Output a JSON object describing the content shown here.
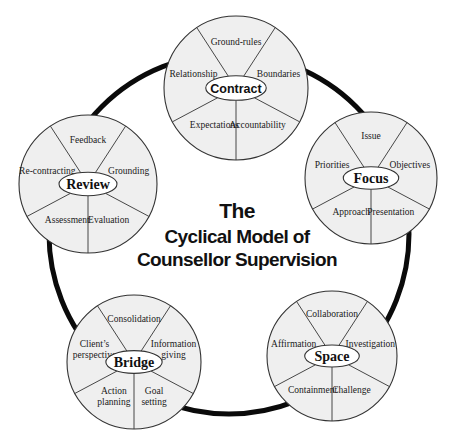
{
  "title": {
    "lines": [
      "The",
      "Cyclical Model of",
      "Counsellor Supervision"
    ]
  },
  "stages": [
    {
      "name": "Contract",
      "hub_style": "sans",
      "segments": [
        "Ground-rules",
        "Boundaries",
        "Accountability",
        "Expectations",
        "Relationship"
      ]
    },
    {
      "name": "Focus",
      "hub_style": "serif",
      "segments": [
        "Issue",
        "Objectives",
        "Presentation",
        "Approach",
        "Priorities"
      ]
    },
    {
      "name": "Space",
      "hub_style": "serif",
      "segments": [
        "Collaboration",
        "Investigation",
        "Challenge",
        "Containment",
        "Affirmation"
      ]
    },
    {
      "name": "Bridge",
      "hub_style": "serif",
      "segments": [
        "Consolidation",
        "Information\ngiving",
        "Goal\nsetting",
        "Action\nplanning",
        "Client’s\nperspective"
      ]
    },
    {
      "name": "Review",
      "hub_style": "serif",
      "segments": [
        "Feedback",
        "Grounding",
        "Evaluation",
        "Assessment",
        "Re-contracting"
      ]
    }
  ],
  "colors": {
    "circle_fill": "#efefef",
    "line": "#333333",
    "cycle_ring": "#0a0a0a",
    "hub_fill": "#ffffff"
  }
}
